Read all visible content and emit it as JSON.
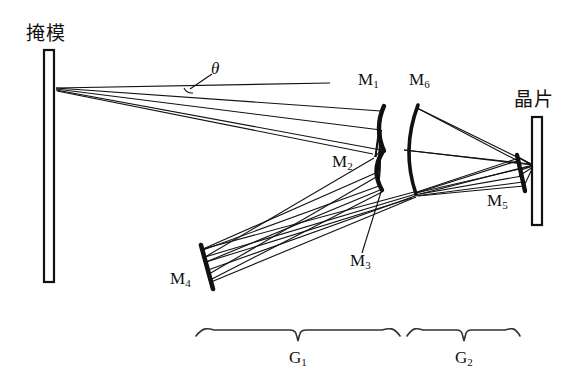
{
  "figure": {
    "kind": "optical-ray-diagram",
    "width": 583,
    "height": 387,
    "background_color": "#ffffff",
    "line_color": "#111111"
  },
  "labels": {
    "mask": "掩模",
    "wafer": "晶片",
    "theta": "θ",
    "mirror_m1": "M",
    "mirror_m1_sub": "1",
    "mirror_m2": "M",
    "mirror_m2_sub": "2",
    "mirror_m3": "M",
    "mirror_m3_sub": "3",
    "mirror_m4": "M",
    "mirror_m4_sub": "4",
    "mirror_m5": "M",
    "mirror_m5_sub": "5",
    "mirror_m6": "M",
    "mirror_m6_sub": "6",
    "group_g1": "G",
    "group_g1_sub": "1",
    "group_g2": "G",
    "group_g2_sub": "2"
  },
  "components": [
    {
      "id": "mask",
      "name": "掩模",
      "type": "plate",
      "x": 48,
      "y": 166
    },
    {
      "id": "m1",
      "name": "M1",
      "type": "concave-mirror",
      "x": 380,
      "y": 128
    },
    {
      "id": "m2",
      "name": "M2",
      "type": "concave-mirror",
      "x": 377,
      "y": 171
    },
    {
      "id": "m3",
      "name": "M3",
      "type": "concave-mirror",
      "x": 378,
      "y": 189
    },
    {
      "id": "m4",
      "name": "M4",
      "type": "flat-mirror",
      "x": 207,
      "y": 267
    },
    {
      "id": "m5",
      "name": "M5",
      "type": "flat-mirror",
      "x": 522,
      "y": 172
    },
    {
      "id": "m6",
      "name": "M6",
      "type": "convex-mirror",
      "x": 412,
      "y": 150
    },
    {
      "id": "wafer",
      "name": "晶片",
      "type": "plate",
      "x": 537,
      "y": 171
    }
  ],
  "groups": [
    {
      "id": "g1",
      "label": "G1",
      "span_start_x": 195,
      "span_end_x": 400
    },
    {
      "id": "g2",
      "label": "G2",
      "span_start_x": 406,
      "span_end_x": 520
    }
  ],
  "annotations": [
    {
      "id": "theta-angle",
      "label": "θ",
      "vertex_x": 190,
      "vertex_y": 88,
      "leader_to_x": 212,
      "leader_to_y": 73
    }
  ]
}
